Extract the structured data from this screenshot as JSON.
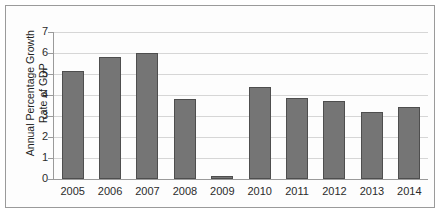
{
  "chart_data": {
    "type": "bar",
    "title": "",
    "subtitle": "",
    "xlabel": "",
    "ylabel": "Annual Percentage Growth\nRate of GDP",
    "categories": [
      "2005",
      "2006",
      "2007",
      "2008",
      "2009",
      "2010",
      "2011",
      "2012",
      "2013",
      "2014"
    ],
    "values": [
      5.15,
      5.8,
      6.0,
      3.8,
      0.15,
      4.4,
      3.87,
      3.7,
      3.2,
      3.45
    ],
    "ylim": [
      0,
      7
    ],
    "ytick_labels": [
      "7",
      "6",
      "5",
      "4",
      "3",
      "2",
      "1",
      "0"
    ],
    "ytick_values": [
      7,
      6,
      5,
      4,
      3,
      2,
      1,
      0
    ],
    "ytick_step": 1,
    "grid": true,
    "grid_axis": "y",
    "legend": false,
    "legend_position": "none",
    "annotations": [],
    "series": [
      {
        "name": "Annual Percentage Growth Rate of GDP",
        "values": [
          5.15,
          5.8,
          6.0,
          3.8,
          0.15,
          4.4,
          3.87,
          3.7,
          3.2,
          3.45
        ]
      }
    ]
  },
  "colors": {
    "bar_fill": "#757575",
    "bar_border": "#4e4e4e",
    "gridline": "#d6d6d6",
    "axis": "#9a9a9a",
    "frame": "#9a9a9a",
    "text": "#2b2b2b",
    "background": "#ffffff"
  }
}
